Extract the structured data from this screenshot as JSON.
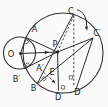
{
  "figure": {
    "type": "geometry-rotation-diagram",
    "colors": {
      "background": "#fbfbfb",
      "ink": "#2e2e2e"
    },
    "labels": {
      "O": "O",
      "P": "P",
      "A": "A",
      "A_prime": "A′",
      "B": "B",
      "B_prime": "B′",
      "C": "C",
      "C_prime": "C′",
      "D": "D",
      "D_prime": "D′",
      "E": "E"
    },
    "elements": {
      "circles": [
        "small-circle-centered-O",
        "large-circle-centered-P"
      ],
      "arrows": [
        "direction-arrow-O-to-P",
        "curved-rotation-arrow-C-to-C-prime",
        "dashed-arrow-toward-D-prime"
      ],
      "marks": [
        "right-angle-marks-x5"
      ],
      "dots": [
        "point-O",
        "point-P"
      ]
    }
  }
}
